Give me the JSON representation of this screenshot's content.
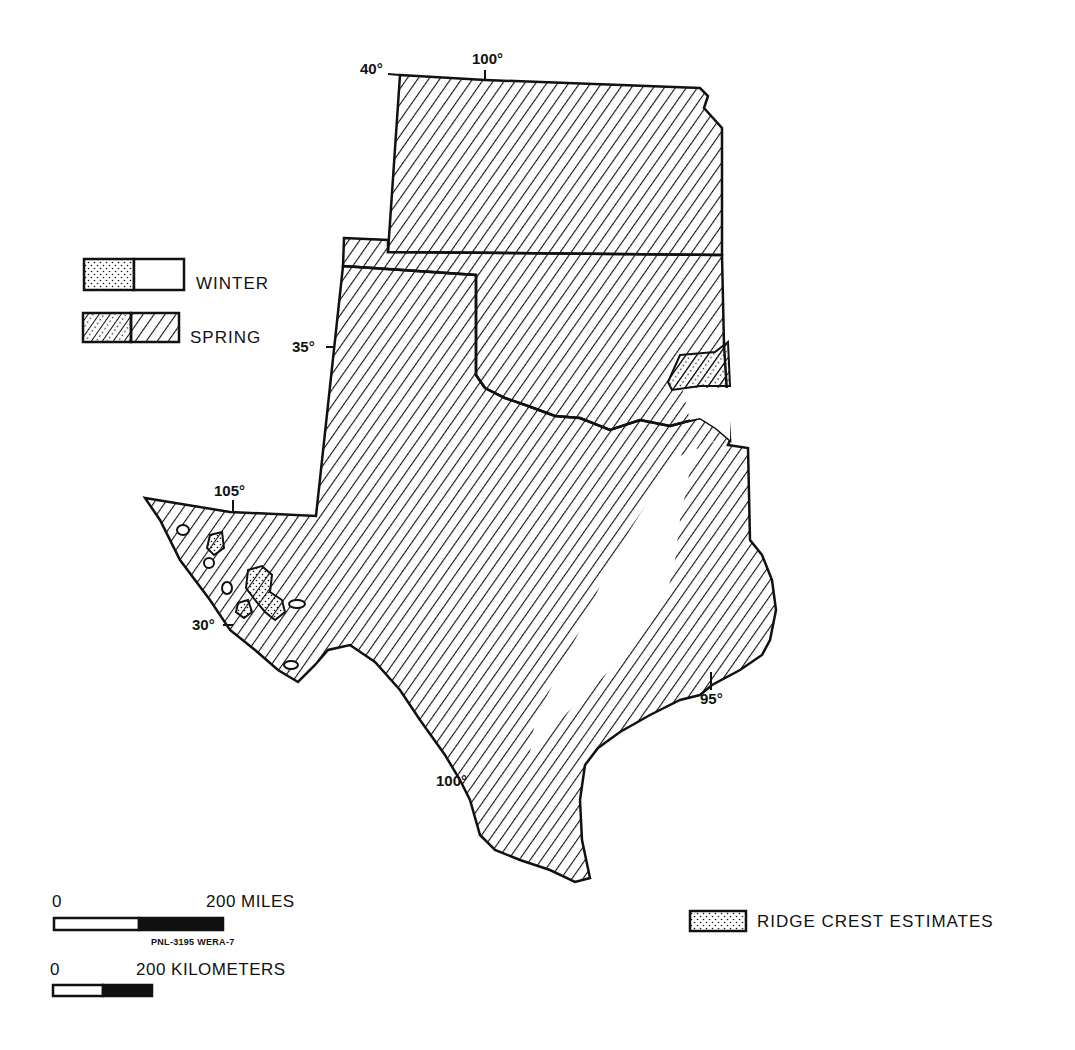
{
  "map": {
    "region": "Kansas, Oklahoma, Texas",
    "figure_id": "PNL-3195 WERA-7",
    "colors": {
      "ink": "#111111",
      "paper": "#ffffff"
    }
  },
  "graticule_labels": {
    "lat_40": "40°",
    "lon_100_top": "100°",
    "lat_35": "35°",
    "lon_105": "105°",
    "lat_30": "30°",
    "lon_100_bottom": "100°",
    "lon_95": "95°"
  },
  "legend": {
    "items": [
      {
        "key": "winter",
        "label": "WINTER",
        "swatch": "stippled-left / blank-right"
      },
      {
        "key": "spring",
        "label": "SPRING",
        "swatch": "stippled-hatched-left / hatched-right"
      },
      {
        "key": "ridge",
        "label": "RIDGE CREST ESTIMATES",
        "swatch": "stippled"
      }
    ]
  },
  "scale_bars": {
    "miles": {
      "start": "0",
      "end_label": "200 MILES"
    },
    "kilometers": {
      "start": "0",
      "end_label": "200 KILOMETERS"
    }
  }
}
